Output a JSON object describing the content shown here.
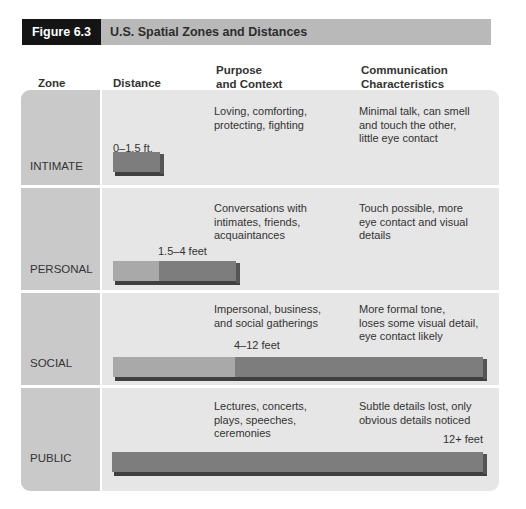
{
  "figure": {
    "label": "Figure 6.3",
    "title": "U.S. Spatial Zones and Distances"
  },
  "columns": {
    "zone": "Zone",
    "distance": "Distance",
    "purpose": "Purpose\nand Context",
    "communication": "Communication\nCharacteristics"
  },
  "rows": [
    {
      "zone": "INTIMATE",
      "distance": "0–1.5 ft.",
      "purpose": "Loving, comforting,\nprotecting, fighting",
      "communication": "Minimal talk, can smell\nand touch the other,\nlittle eye contact"
    },
    {
      "zone": "PERSONAL",
      "distance": "1.5–4 feet",
      "purpose": "Conversations with\nintimates, friends,\nacquaintances",
      "communication": "Touch possible, more\neye contact and visual\ndetails"
    },
    {
      "zone": "SOCIAL",
      "distance": "4–12 feet",
      "purpose": "Impersonal, business,\nand social gatherings",
      "communication": "More formal tone,\nloses some visual detail,\neye contact likely"
    },
    {
      "zone": "PUBLIC",
      "distance": "12+ feet",
      "purpose": "Lectures, concerts,\nplays, speeches,\nceremonies",
      "communication": "Subtle details lost, only\nobvious details noticed"
    }
  ],
  "colors": {
    "header_label_bg": "#141414",
    "header_bar_bg": "#b9b9b9",
    "zone_cell_bg": "#c9c9c9",
    "content_cell_bg": "#e6e6e6",
    "bar_light": "#a9a9a9",
    "bar_dark": "#7d7d7d"
  }
}
